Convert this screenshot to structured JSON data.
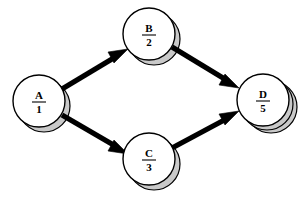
{
  "diagram": {
    "background_color": "#ffffff",
    "node_fill_color": "#ffffff",
    "node_stroke_color": "#000000",
    "shadow_color": "#c9c9c9",
    "edge_color": "#000000",
    "nodes": [
      {
        "id": "A",
        "letter": "A",
        "number": "1",
        "cx": 39,
        "cy": 101,
        "r": 26,
        "shadow_dx": 5,
        "shadow_dy": 5
      },
      {
        "id": "B",
        "letter": "B",
        "number": "2",
        "cx": 149,
        "cy": 34,
        "r": 26,
        "shadow_dx": 5,
        "shadow_dy": 5
      },
      {
        "id": "C",
        "letter": "C",
        "number": "3",
        "cx": 149,
        "cy": 159,
        "r": 26,
        "shadow_dx": 5,
        "shadow_dy": 5
      },
      {
        "id": "D",
        "letter": "D",
        "number": "5",
        "cx": 263,
        "cy": 100,
        "r": 26,
        "shadow_dx": 7,
        "shadow_dy": 6
      }
    ],
    "edges": [
      {
        "id": "A-B",
        "from": "A",
        "to": "B",
        "label": ""
      },
      {
        "id": "A-C",
        "from": "A",
        "to": "C",
        "label": ""
      },
      {
        "id": "B-D",
        "from": "B",
        "to": "D",
        "label": ""
      },
      {
        "id": "C-D",
        "from": "C",
        "to": "D",
        "label": ""
      }
    ]
  }
}
